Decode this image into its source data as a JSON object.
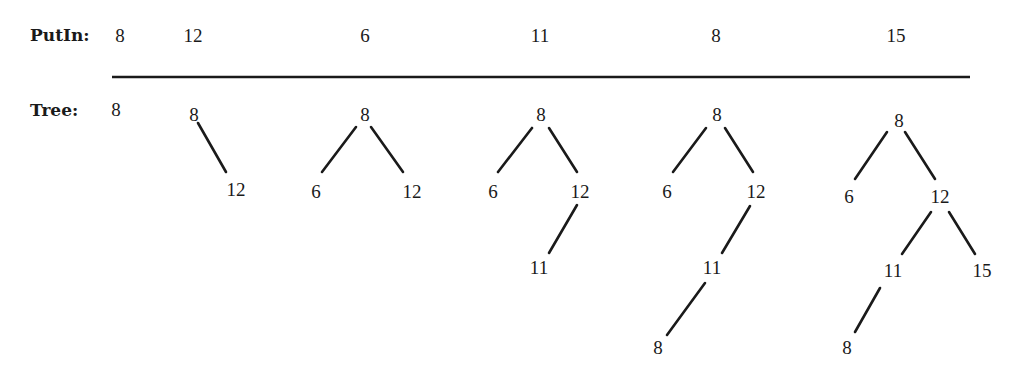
{
  "labels": {
    "putin": "PutIn:",
    "tree": "Tree:"
  },
  "inserts": [
    {
      "value": "8",
      "x": 120
    },
    {
      "value": "12",
      "x": 193
    },
    {
      "value": "6",
      "x": 365
    },
    {
      "value": "11",
      "x": 540
    },
    {
      "value": "8",
      "x": 716
    },
    {
      "value": "15",
      "x": 896
    }
  ],
  "rule": {
    "x1": 112,
    "x2": 970,
    "y": 77
  },
  "trees": [
    {
      "step": 1,
      "nodes": [
        {
          "id": "a",
          "value": "8",
          "x": 116,
          "y": 110
        }
      ],
      "edges": []
    },
    {
      "step": 2,
      "nodes": [
        {
          "id": "a",
          "value": "8",
          "x": 194,
          "y": 115
        },
        {
          "id": "b",
          "value": "12",
          "x": 236,
          "y": 190
        }
      ],
      "edges": [
        {
          "x1": 198,
          "y1": 123,
          "x2": 226,
          "y2": 172
        }
      ]
    },
    {
      "step": 3,
      "nodes": [
        {
          "id": "a",
          "value": "8",
          "x": 365,
          "y": 115
        },
        {
          "id": "b",
          "value": "6",
          "x": 316,
          "y": 192
        },
        {
          "id": "c",
          "value": "12",
          "x": 412,
          "y": 192
        }
      ],
      "edges": [
        {
          "x1": 356,
          "y1": 127,
          "x2": 322,
          "y2": 172
        },
        {
          "x1": 371,
          "y1": 127,
          "x2": 403,
          "y2": 172
        }
      ]
    },
    {
      "step": 4,
      "nodes": [
        {
          "id": "a",
          "value": "8",
          "x": 541,
          "y": 115
        },
        {
          "id": "b",
          "value": "6",
          "x": 493,
          "y": 192
        },
        {
          "id": "c",
          "value": "12",
          "x": 580,
          "y": 192
        },
        {
          "id": "d",
          "value": "11",
          "x": 539,
          "y": 268
        }
      ],
      "edges": [
        {
          "x1": 532,
          "y1": 128,
          "x2": 498,
          "y2": 172
        },
        {
          "x1": 549,
          "y1": 128,
          "x2": 577,
          "y2": 172
        },
        {
          "x1": 577,
          "y1": 205,
          "x2": 549,
          "y2": 253
        }
      ]
    },
    {
      "step": 5,
      "nodes": [
        {
          "id": "a",
          "value": "8",
          "x": 717,
          "y": 115
        },
        {
          "id": "b",
          "value": "6",
          "x": 667,
          "y": 192
        },
        {
          "id": "c",
          "value": "12",
          "x": 756,
          "y": 192
        },
        {
          "id": "d",
          "value": "11",
          "x": 712,
          "y": 268
        },
        {
          "id": "e",
          "value": "8",
          "x": 658,
          "y": 348
        }
      ],
      "edges": [
        {
          "x1": 706,
          "y1": 128,
          "x2": 673,
          "y2": 172
        },
        {
          "x1": 725,
          "y1": 128,
          "x2": 753,
          "y2": 172
        },
        {
          "x1": 750,
          "y1": 206,
          "x2": 722,
          "y2": 253
        },
        {
          "x1": 705,
          "y1": 283,
          "x2": 667,
          "y2": 335
        }
      ]
    },
    {
      "step": 6,
      "nodes": [
        {
          "id": "a",
          "value": "8",
          "x": 899,
          "y": 121
        },
        {
          "id": "b",
          "value": "6",
          "x": 849,
          "y": 197
        },
        {
          "id": "c",
          "value": "12",
          "x": 940,
          "y": 197
        },
        {
          "id": "d",
          "value": "11",
          "x": 893,
          "y": 271
        },
        {
          "id": "e",
          "value": "15",
          "x": 982,
          "y": 271
        },
        {
          "id": "f",
          "value": "8",
          "x": 847,
          "y": 348
        }
      ],
      "edges": [
        {
          "x1": 887,
          "y1": 132,
          "x2": 855,
          "y2": 179
        },
        {
          "x1": 905,
          "y1": 132,
          "x2": 935,
          "y2": 179
        },
        {
          "x1": 931,
          "y1": 212,
          "x2": 902,
          "y2": 254
        },
        {
          "x1": 949,
          "y1": 212,
          "x2": 975,
          "y2": 254
        },
        {
          "x1": 880,
          "y1": 288,
          "x2": 855,
          "y2": 332
        }
      ]
    }
  ]
}
